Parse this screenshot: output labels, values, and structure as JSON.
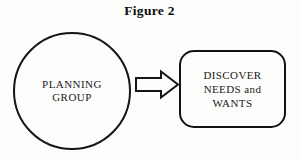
{
  "figure": {
    "title": "Figure 2",
    "background_color": "#fdfdfc",
    "ink_color": "#151515"
  },
  "diagram_data": {
    "type": "flow",
    "orientation": "left-to-right",
    "nodes": [
      {
        "id": "planning-group",
        "shape": "circle",
        "label": "PLANNING\nGROUP",
        "fill": "none",
        "stroke": "#151515"
      },
      {
        "id": "discover-needs-wants",
        "shape": "rounded-rectangle",
        "label": "DISCOVER\nNEEDS and\nWANTS",
        "fill": "none",
        "stroke": "#131313"
      }
    ],
    "edges": [
      {
        "id": "planning-to-discover",
        "from": "planning-group",
        "to": "discover-needs-wants",
        "style": "hollow-block-arrow",
        "direction": "right",
        "label": ""
      }
    ]
  }
}
